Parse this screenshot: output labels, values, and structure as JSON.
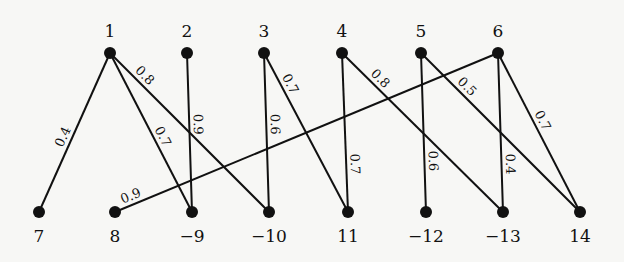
{
  "diagram": {
    "type": "bipartite-weighted-graph",
    "top_nodes": [
      {
        "id": "1",
        "label": "1",
        "x": 110,
        "y": 53
      },
      {
        "id": "2",
        "label": "2",
        "x": 187,
        "y": 53
      },
      {
        "id": "3",
        "label": "3",
        "x": 264,
        "y": 53
      },
      {
        "id": "4",
        "label": "4",
        "x": 342,
        "y": 53
      },
      {
        "id": "5",
        "label": "5",
        "x": 421,
        "y": 53
      },
      {
        "id": "6",
        "label": "6",
        "x": 498,
        "y": 53
      }
    ],
    "bottom_nodes": [
      {
        "id": "7",
        "label": "7",
        "x": 39,
        "y": 212
      },
      {
        "id": "8",
        "label": "8",
        "x": 115,
        "y": 212
      },
      {
        "id": "-9",
        "label": "−9",
        "x": 192,
        "y": 212
      },
      {
        "id": "-10",
        "label": "−10",
        "x": 269,
        "y": 212
      },
      {
        "id": "11",
        "label": "11",
        "x": 348,
        "y": 212
      },
      {
        "id": "-12",
        "label": "−12",
        "x": 426,
        "y": 212
      },
      {
        "id": "-13",
        "label": "−13",
        "x": 503,
        "y": 212
      },
      {
        "id": "14",
        "label": "14",
        "x": 580,
        "y": 212
      }
    ],
    "edges": [
      {
        "from": "1",
        "to": "7",
        "weight": "0.4"
      },
      {
        "from": "1",
        "to": "-9",
        "weight": "0.7"
      },
      {
        "from": "1",
        "to": "-10",
        "weight": "0.8"
      },
      {
        "from": "2",
        "to": "-9",
        "weight": "0.9"
      },
      {
        "from": "3",
        "to": "-10",
        "weight": "0.6"
      },
      {
        "from": "3",
        "to": "11",
        "weight": "0.7"
      },
      {
        "from": "4",
        "to": "11",
        "weight": "0.7"
      },
      {
        "from": "4",
        "to": "-13",
        "weight": "0.8"
      },
      {
        "from": "5",
        "to": "-12",
        "weight": "0.6"
      },
      {
        "from": "5",
        "to": "14",
        "weight": "0.5"
      },
      {
        "from": "6",
        "to": "8",
        "weight": "0.9"
      },
      {
        "from": "6",
        "to": "-13",
        "weight": "0.4"
      },
      {
        "from": "6",
        "to": "14",
        "weight": "0.7"
      }
    ],
    "colors": {
      "ink": "#111111",
      "background": "#f7f7f5"
    }
  }
}
